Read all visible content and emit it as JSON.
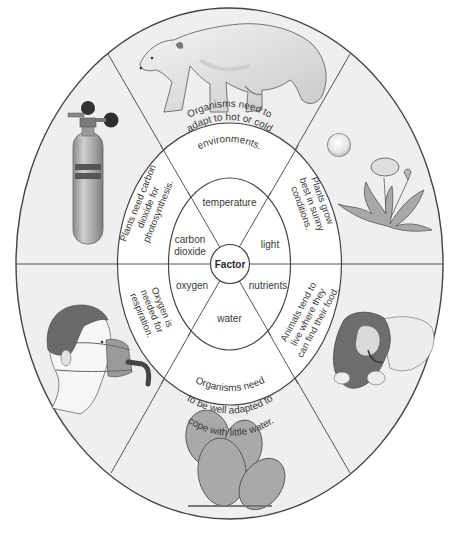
{
  "diagram": {
    "center_label": "Factor",
    "colors": {
      "background": "#ffffff",
      "outer_fill": "#efefef",
      "ring_fill": "#ffffff",
      "stroke": "#444444",
      "text": "#3a3a3a",
      "illustration_dark": "#5a5a5a",
      "illustration_mid": "#9a9a9a",
      "illustration_light": "#d6d6d6"
    },
    "factors": [
      {
        "name": "temperature",
        "explanation_lines": [
          "Organisms need to",
          "adapt to hot or cold",
          "environments."
        ],
        "illustration": "polar-bear"
      },
      {
        "name": "light",
        "explanation_lines": [
          "Plants grow",
          "best in sunny",
          "conditions."
        ],
        "illustration": "sun-and-dandelion"
      },
      {
        "name": "nutrients",
        "explanation_lines": [
          "Animals tend to",
          "live where they",
          "can find their food."
        ],
        "illustration": "lion-eating"
      },
      {
        "name": "water",
        "explanation_lines": [
          "Organisms need",
          "to be well adapted to",
          "cope with little water."
        ],
        "illustration": "cactus"
      },
      {
        "name": "oxygen",
        "explanation_lines": [
          "Oxygen is",
          "needed for",
          "respiration."
        ],
        "illustration": "man-with-oxygen-mask"
      },
      {
        "name_lines": [
          "carbon",
          "dioxide"
        ],
        "name": "carbon dioxide",
        "explanation_lines": [
          "Plants need carbon",
          "dioxide for",
          "photosynthesis."
        ],
        "illustration": "carbon-dioxide-cylinder"
      }
    ]
  }
}
